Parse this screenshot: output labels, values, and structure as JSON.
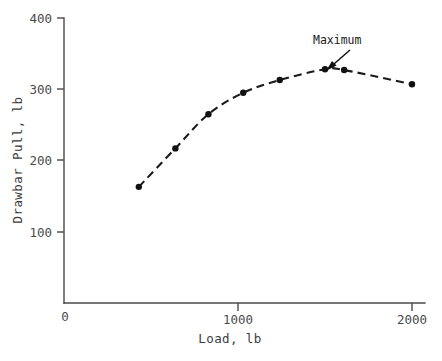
{
  "chart_data": {
    "type": "line",
    "title": "",
    "subtitle": "",
    "xlabel": "Load, lb",
    "ylabel": "Drawbar Pull, lb",
    "xlim": [
      0,
      2000
    ],
    "ylim": [
      0,
      400
    ],
    "grid": false,
    "legend": "none",
    "line_style": "dashed",
    "marker": "filled-circle",
    "x": [
      430,
      640,
      830,
      1030,
      1240,
      1500,
      1610,
      2000
    ],
    "values": [
      163,
      217,
      265,
      295,
      313,
      328,
      327,
      307
    ],
    "points": [
      {
        "x": 430,
        "y": 163
      },
      {
        "x": 640,
        "y": 217
      },
      {
        "x": 830,
        "y": 265
      },
      {
        "x": 1030,
        "y": 295
      },
      {
        "x": 1240,
        "y": 313
      },
      {
        "x": 1500,
        "y": 328
      },
      {
        "x": 1610,
        "y": 327
      },
      {
        "x": 2000,
        "y": 307
      }
    ],
    "xticks": [
      0,
      1000,
      2000
    ],
    "xticklabels": [
      "0",
      "1000",
      "2000"
    ],
    "yticks": [
      0,
      100,
      200,
      300,
      400
    ],
    "yticklabels": [
      "0",
      "100",
      "200",
      "300",
      "400"
    ],
    "annotations": [
      {
        "text": "Maximum",
        "target_x": 1500,
        "target_y": 328,
        "label_x": 1500,
        "label_y": 395
      }
    ]
  },
  "axes": {
    "y_title": "Drawbar Pull, lb",
    "x_title": "Load, lb",
    "y_labels": {
      "t400": "400",
      "t300": "300",
      "t200": "200",
      "t100": "100",
      "t0": "0"
    },
    "x_labels": {
      "t1000": "1000",
      "t2000": "2000"
    }
  },
  "annotation": {
    "maximum_label": "Maximum"
  },
  "colors": {
    "axis": "#4a4a4a",
    "curve": "#1a1a1a",
    "marker": "#111111",
    "text": "#3c3c3c",
    "background": "#ffffff"
  }
}
